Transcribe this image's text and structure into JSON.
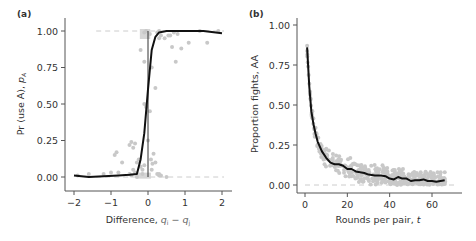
{
  "chart_data": [
    {
      "panel": "(a)",
      "type": "scatter",
      "xlabel": "Difference, q_i − q_j",
      "ylabel": "Pr (use A), p_A",
      "xlim": [
        -2.2,
        2.2
      ],
      "ylim": [
        -0.05,
        1.05
      ],
      "xticks": [
        "−2",
        "−1",
        "0",
        "1",
        "2"
      ],
      "yticks": [
        "0.00",
        "0.25",
        "0.50",
        "0.75",
        "1.00"
      ],
      "reference_lines": {
        "horizontal_dashed": [
          0.0,
          1.0
        ],
        "vertical_solid": [
          0.0
        ]
      },
      "fit_curve": {
        "x": [
          -2.0,
          -1.6,
          -1.2,
          -0.8,
          -0.5,
          -0.3,
          -0.2,
          -0.1,
          0.0,
          0.1,
          0.2,
          0.3,
          0.5,
          1.0,
          1.5,
          2.0
        ],
        "y": [
          0.01,
          0.0,
          0.005,
          0.01,
          0.015,
          0.02,
          0.12,
          0.3,
          0.6,
          0.87,
          0.96,
          0.99,
          1.0,
          1.0,
          1.0,
          0.985
        ]
      },
      "points": {
        "x": [
          -1.9,
          -1.6,
          -1.2,
          -1.0,
          -0.9,
          -0.85,
          -0.8,
          -0.7,
          -0.5,
          -0.45,
          -0.4,
          -0.35,
          -0.3,
          -0.25,
          -0.2,
          -0.15,
          -0.1,
          -0.1,
          -0.05,
          0.05,
          0.08,
          0.12,
          0.15,
          0.2,
          0.25,
          0.3,
          -0.35,
          -0.4,
          -0.45,
          -0.5,
          -0.2,
          -0.1,
          0.1,
          0.2,
          0.3,
          0.35,
          -0.1,
          -0.05,
          0.05,
          0.25,
          0.3,
          0.45,
          0.55,
          0.65,
          0.75,
          0.9,
          1.1,
          1.4,
          1.6,
          1.9,
          -0.3,
          -0.15,
          0.0,
          0.1,
          0.3,
          0.35,
          0.5,
          0.6,
          0.7,
          0.8
        ],
        "y": [
          0.01,
          0.02,
          0.02,
          0.03,
          0.15,
          0.17,
          0.03,
          0.1,
          0.22,
          0.24,
          0.2,
          0.23,
          0.1,
          0.12,
          0.07,
          0.05,
          0.08,
          0.5,
          0.48,
          0.45,
          0.12,
          0.09,
          0.16,
          0.1,
          0.02,
          0.01,
          0.03,
          0.05,
          0.01,
          0.02,
          0.87,
          0.79,
          0.75,
          0.61,
          0.95,
          0.97,
          0.99,
          1.0,
          0.98,
          0.99,
          1.0,
          0.95,
          0.97,
          0.89,
          0.79,
          0.88,
          0.92,
          1.0,
          0.92,
          1.0,
          0.0,
          0.02,
          0.25,
          0.05,
          0.02,
          0.01,
          0.0,
          0.97,
          0.99,
          0.98
        ]
      }
    },
    {
      "panel": "(b)",
      "type": "scatter",
      "xlabel": "Rounds per pair, t",
      "ylabel": "Proportion fights, AA",
      "xlim": [
        -3,
        72
      ],
      "ylim": [
        -0.05,
        1.05
      ],
      "xticks": [
        "0",
        "20",
        "40",
        "60"
      ],
      "yticks": [
        "0.00",
        "0.25",
        "0.50",
        "0.75",
        "1.00"
      ],
      "reference_lines": {
        "horizontal_dashed": [
          0.0
        ]
      },
      "fit_curve": {
        "x": [
          1,
          2,
          3,
          4,
          5,
          6,
          8,
          10,
          12,
          14,
          16,
          18,
          20,
          22,
          24,
          26,
          28,
          30,
          33,
          36,
          38,
          40,
          42,
          44,
          46,
          48,
          50,
          52,
          54,
          56,
          58,
          60,
          62,
          64,
          66
        ],
        "y": [
          0.86,
          0.62,
          0.46,
          0.38,
          0.32,
          0.27,
          0.21,
          0.17,
          0.14,
          0.13,
          0.13,
          0.12,
          0.1,
          0.1,
          0.085,
          0.08,
          0.075,
          0.065,
          0.06,
          0.06,
          0.055,
          0.04,
          0.035,
          0.05,
          0.04,
          0.04,
          0.025,
          0.03,
          0.03,
          0.035,
          0.025,
          0.025,
          0.02,
          0.025,
          0.03
        ]
      },
      "points_description": "Dense grey scatter of per-round observations around the decay curve, spread roughly ±0.07 around the fit, all values ≥ 0."
    }
  ]
}
